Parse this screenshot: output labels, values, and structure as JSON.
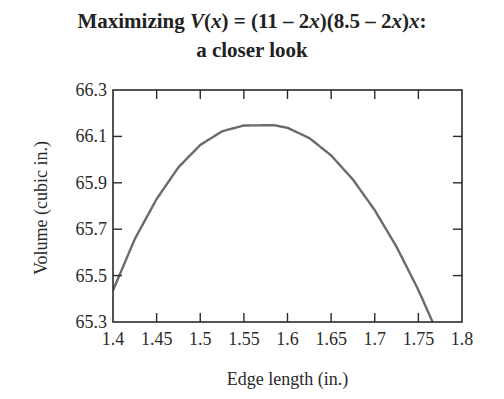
{
  "title": {
    "line1_prefix": "Maximizing ",
    "line1_fn": "V",
    "line1_paren_open": "(",
    "line1_var": "x",
    "line1_mid": ") = (11 – 2",
    "line1_var2": "x",
    "line1_mid2": ")(8.5 – 2",
    "line1_var3": "x",
    "line1_mid3": ")",
    "line1_var4": "x",
    "line1_end": ":",
    "line2": "a closer look"
  },
  "chart_data": {
    "type": "line",
    "xlabel": "Edge length (in.)",
    "ylabel": "Volume (cubic in.)",
    "xlim": [
      1.4,
      1.8
    ],
    "ylim": [
      65.3,
      66.3
    ],
    "xticks": [
      1.4,
      1.45,
      1.5,
      1.55,
      1.6,
      1.65,
      1.7,
      1.75,
      1.8
    ],
    "xtick_labels": [
      "1.4",
      "1.45",
      "1.5",
      "1.55",
      "1.6",
      "1.65",
      "1.7",
      "1.75",
      "1.8"
    ],
    "yticks": [
      65.3,
      65.5,
      65.7,
      65.9,
      66.1,
      66.3
    ],
    "ytick_labels": [
      "65.3",
      "65.5",
      "65.7",
      "65.9",
      "66.1",
      "66.3"
    ],
    "grid": false,
    "legend": null,
    "function": "V(x) = (11 - 2x)(8.5 - 2x)x",
    "series": [
      {
        "name": "V(x)",
        "color": "#6b6b6b",
        "x": [
          1.4,
          1.425,
          1.45,
          1.475,
          1.5,
          1.525,
          1.55,
          1.575,
          1.585,
          1.6,
          1.625,
          1.65,
          1.675,
          1.7,
          1.725,
          1.75,
          1.775,
          1.8
        ],
        "y": [
          65.436,
          65.658,
          65.83,
          65.967,
          66.063,
          66.122,
          66.147,
          66.148,
          66.148,
          66.137,
          66.093,
          66.018,
          65.914,
          65.782,
          65.624,
          65.438,
          65.226,
          64.998
        ]
      }
    ]
  },
  "colors": {
    "axis": "#2a2a2a",
    "curve": "#6b6b6b",
    "background": "#ffffff"
  }
}
